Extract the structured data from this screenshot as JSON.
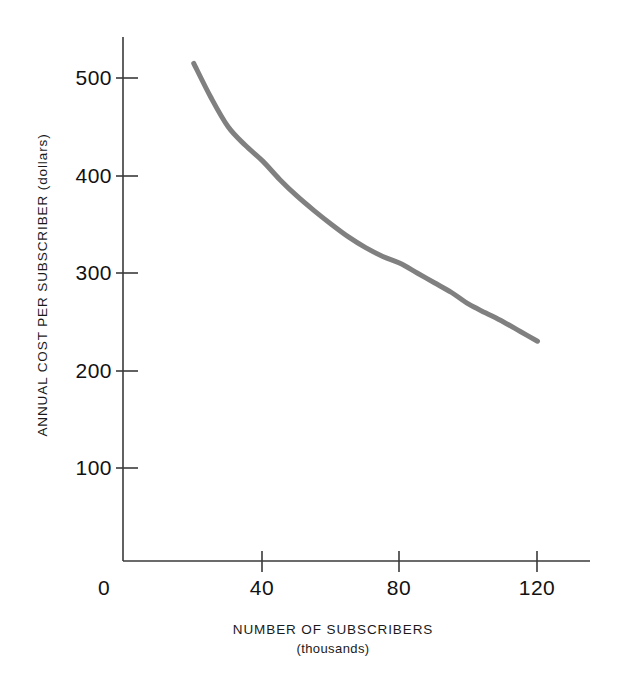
{
  "chart_data": {
    "type": "line",
    "title": "",
    "xlabel": "NUMBER OF SUBSCRIBERS",
    "xlabel_sub": "(thousands)",
    "ylabel": "ANNUAL COST PER SUBSCRIBER (dollars)",
    "x": [
      20,
      25,
      30,
      35,
      40,
      45,
      50,
      55,
      60,
      65,
      70,
      75,
      80,
      85,
      90,
      95,
      100,
      105,
      110,
      115,
      120
    ],
    "values": [
      515,
      480,
      450,
      431,
      415,
      396,
      379,
      364,
      350,
      337,
      326,
      317,
      310,
      300,
      290,
      280,
      268,
      259,
      250,
      240,
      230
    ],
    "series": [
      {
        "name": "Annual cost per subscriber",
        "values": [
          515,
          480,
          450,
          431,
          415,
          396,
          379,
          364,
          350,
          337,
          326,
          317,
          310,
          300,
          290,
          280,
          268,
          259,
          250,
          240,
          230
        ]
      }
    ],
    "xlim": [
      0,
      130
    ],
    "ylim": [
      0,
      560
    ],
    "xticks": [
      0,
      40,
      80,
      120
    ],
    "xtick_labels": [
      "0",
      "40",
      "80",
      "120"
    ],
    "yticks": [
      100,
      200,
      300,
      400,
      500
    ],
    "ytick_labels": [
      "100",
      "200",
      "300",
      "400",
      "500"
    ],
    "grid": false,
    "legend": false,
    "line_color": "#808080",
    "line_width": 5,
    "axis_color": "#3a3a3a",
    "background": "#ffffff"
  },
  "axes": {
    "x_title": "NUMBER OF SUBSCRIBERS",
    "x_subtitle": "(thousands)",
    "y_title": "ANNUAL COST PER SUBSCRIBER (dollars)"
  },
  "ticks": {
    "y": [
      {
        "label": "500",
        "value": 500
      },
      {
        "label": "400",
        "value": 400
      },
      {
        "label": "300",
        "value": 300
      },
      {
        "label": "200",
        "value": 200
      },
      {
        "label": "100",
        "value": 100
      }
    ],
    "x": [
      {
        "label": "0",
        "value": 0
      },
      {
        "label": "40",
        "value": 40
      },
      {
        "label": "80",
        "value": 80
      },
      {
        "label": "120",
        "value": 120
      }
    ]
  }
}
